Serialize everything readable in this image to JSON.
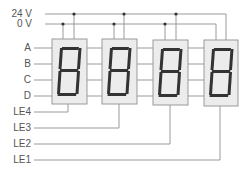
{
  "diagram": {
    "type": "wiring-diagram",
    "power_labels": {
      "v24": "24 V",
      "v0": "0 V"
    },
    "data_labels": [
      "A",
      "B",
      "C",
      "D"
    ],
    "latch_labels": [
      "LE4",
      "LE3",
      "LE2",
      "LE1"
    ],
    "displays": [
      {
        "id": "display-1",
        "digit": "8",
        "latch": "LE4"
      },
      {
        "id": "display-2",
        "digit": "8",
        "latch": "LE3"
      },
      {
        "id": "display-3",
        "digit": "8",
        "latch": "LE2"
      },
      {
        "id": "display-4",
        "digit": "8",
        "latch": "LE1"
      }
    ],
    "colors": {
      "wire": "#999999",
      "box_fill": "#ececec",
      "box_border": "#9a9a9a",
      "segment": "#333333",
      "label": "#555555",
      "junction": "#333333"
    }
  }
}
